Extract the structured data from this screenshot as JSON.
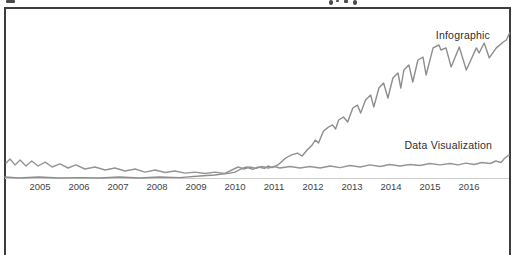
{
  "page": {
    "background": "#ffffff",
    "frame_border_color": "#3d3d3d",
    "top_edge": "bottom sliver of a clipped text line"
  },
  "chart_data": {
    "type": "line",
    "title": "",
    "xlabel": "",
    "ylabel": "",
    "grid": false,
    "legend_position": "inline labels at line ends",
    "x_axis": {
      "tick_labels": [
        "2005",
        "2006",
        "2007",
        "2008",
        "2009",
        "2010",
        "2011",
        "2012",
        "2013",
        "2014",
        "2015",
        "2016"
      ],
      "range_years": [
        2004.1,
        2017.05
      ]
    },
    "y_axis": {
      "visible": false,
      "ylim": [
        0,
        100
      ]
    },
    "colors": {
      "infographic_line": "#8d8d8d",
      "data_visualization_line": "#949494",
      "axis_line": "#cccccc",
      "tick_text": "#3f3f3f",
      "label_text": "#2e2e2e"
    },
    "series": [
      {
        "name": "Infographic",
        "points": [
          [
            2004.1,
            0.7
          ],
          [
            2004.46,
            0.0
          ],
          [
            2004.97,
            0.7
          ],
          [
            2005.49,
            0.0
          ],
          [
            2006.01,
            0.3
          ],
          [
            2006.52,
            0.0
          ],
          [
            2007.04,
            0.7
          ],
          [
            2007.55,
            0.0
          ],
          [
            2008.07,
            0.7
          ],
          [
            2008.58,
            0.3
          ],
          [
            2009.1,
            1.4
          ],
          [
            2009.48,
            2.1
          ],
          [
            2009.87,
            3.4
          ],
          [
            2010.0,
            4.1
          ],
          [
            2010.15,
            6.2
          ],
          [
            2010.3,
            7.6
          ],
          [
            2010.45,
            5.9
          ],
          [
            2010.6,
            7.6
          ],
          [
            2010.75,
            6.6
          ],
          [
            2010.85,
            8.3
          ],
          [
            2010.95,
            7.2
          ],
          [
            2011.1,
            9.0
          ],
          [
            2011.3,
            13.8
          ],
          [
            2011.45,
            15.9
          ],
          [
            2011.6,
            17.2
          ],
          [
            2011.72,
            15.2
          ],
          [
            2011.85,
            19.3
          ],
          [
            2011.98,
            22.8
          ],
          [
            2012.06,
            26.2
          ],
          [
            2012.14,
            24.1
          ],
          [
            2012.27,
            32.4
          ],
          [
            2012.4,
            35.2
          ],
          [
            2012.5,
            36.6
          ],
          [
            2012.58,
            33.8
          ],
          [
            2012.66,
            40.0
          ],
          [
            2012.78,
            42.1
          ],
          [
            2012.89,
            38.6
          ],
          [
            2013.02,
            48.3
          ],
          [
            2013.14,
            50.3
          ],
          [
            2013.22,
            44.8
          ],
          [
            2013.35,
            53.8
          ],
          [
            2013.48,
            57.2
          ],
          [
            2013.56,
            49.0
          ],
          [
            2013.69,
            62.1
          ],
          [
            2013.81,
            65.5
          ],
          [
            2013.92,
            55.2
          ],
          [
            2014.05,
            69.0
          ],
          [
            2014.18,
            72.4
          ],
          [
            2014.25,
            62.1
          ],
          [
            2014.33,
            74.5
          ],
          [
            2014.46,
            77.9
          ],
          [
            2014.56,
            66.2
          ],
          [
            2014.69,
            81.4
          ],
          [
            2014.82,
            83.4
          ],
          [
            2014.9,
            71.0
          ],
          [
            2015.08,
            89.7
          ],
          [
            2015.23,
            91.7
          ],
          [
            2015.28,
            88.3
          ],
          [
            2015.41,
            89.7
          ],
          [
            2015.54,
            76.6
          ],
          [
            2015.75,
            90.3
          ],
          [
            2015.93,
            74.5
          ],
          [
            2016.19,
            89.7
          ],
          [
            2016.26,
            86.2
          ],
          [
            2016.39,
            93.1
          ],
          [
            2016.52,
            82.8
          ],
          [
            2016.7,
            89.7
          ],
          [
            2016.88,
            93.8
          ],
          [
            2016.96,
            95.2
          ],
          [
            2017.04,
            100.0
          ]
        ]
      },
      {
        "name": "Data Visualization",
        "points": [
          [
            2004.13,
            10.3
          ],
          [
            2004.23,
            13.1
          ],
          [
            2004.36,
            9.0
          ],
          [
            2004.49,
            12.4
          ],
          [
            2004.64,
            8.3
          ],
          [
            2004.79,
            11.7
          ],
          [
            2004.95,
            8.3
          ],
          [
            2005.13,
            11.0
          ],
          [
            2005.31,
            7.6
          ],
          [
            2005.51,
            9.7
          ],
          [
            2005.72,
            6.9
          ],
          [
            2005.92,
            9.0
          ],
          [
            2006.15,
            6.2
          ],
          [
            2006.41,
            7.6
          ],
          [
            2006.67,
            5.5
          ],
          [
            2006.92,
            6.9
          ],
          [
            2007.18,
            4.8
          ],
          [
            2007.44,
            6.2
          ],
          [
            2007.69,
            4.1
          ],
          [
            2007.95,
            5.5
          ],
          [
            2008.21,
            3.8
          ],
          [
            2008.46,
            4.8
          ],
          [
            2008.72,
            3.4
          ],
          [
            2008.97,
            4.1
          ],
          [
            2009.23,
            3.1
          ],
          [
            2009.49,
            4.1
          ],
          [
            2009.74,
            3.1
          ],
          [
            2009.92,
            5.5
          ],
          [
            2010.08,
            7.6
          ],
          [
            2010.23,
            6.2
          ],
          [
            2010.38,
            7.6
          ],
          [
            2010.54,
            6.6
          ],
          [
            2010.69,
            7.9
          ],
          [
            2010.85,
            6.9
          ],
          [
            2011.0,
            7.9
          ],
          [
            2011.15,
            6.9
          ],
          [
            2011.41,
            7.9
          ],
          [
            2011.67,
            6.9
          ],
          [
            2011.92,
            7.9
          ],
          [
            2012.18,
            6.9
          ],
          [
            2012.44,
            8.3
          ],
          [
            2012.69,
            7.2
          ],
          [
            2012.95,
            8.6
          ],
          [
            2013.21,
            7.6
          ],
          [
            2013.46,
            9.0
          ],
          [
            2013.72,
            7.9
          ],
          [
            2013.97,
            9.3
          ],
          [
            2014.23,
            8.3
          ],
          [
            2014.49,
            9.3
          ],
          [
            2014.74,
            8.6
          ],
          [
            2015.0,
            10.0
          ],
          [
            2015.26,
            9.0
          ],
          [
            2015.51,
            10.0
          ],
          [
            2015.72,
            9.0
          ],
          [
            2015.92,
            10.3
          ],
          [
            2016.13,
            9.3
          ],
          [
            2016.33,
            10.7
          ],
          [
            2016.54,
            10.0
          ],
          [
            2016.69,
            11.7
          ],
          [
            2016.82,
            10.7
          ],
          [
            2016.92,
            13.8
          ],
          [
            2017.03,
            15.9
          ]
        ]
      }
    ]
  }
}
